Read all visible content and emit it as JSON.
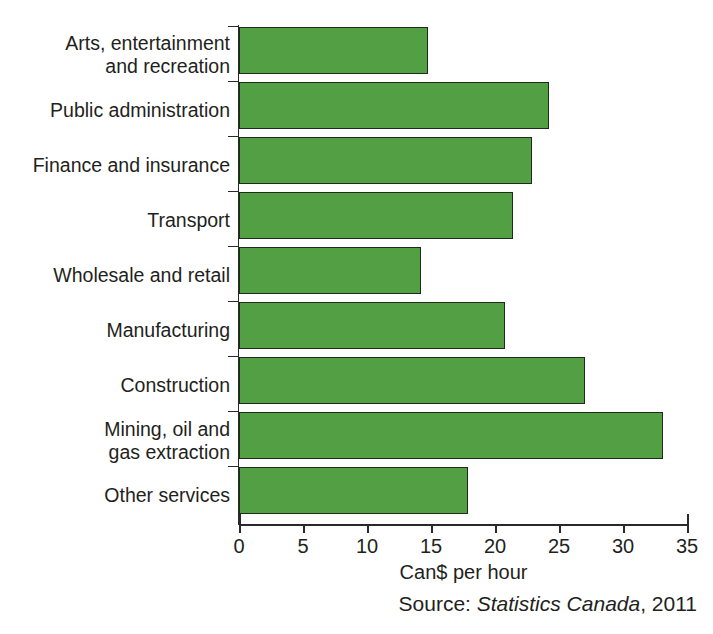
{
  "chart_data": {
    "type": "bar",
    "orientation": "horizontal",
    "title": "",
    "xlabel": "Can$ per hour",
    "ylabel": "",
    "xlim": [
      0,
      35
    ],
    "xticks": [
      0,
      5,
      10,
      15,
      20,
      25,
      30,
      35
    ],
    "xtick_labels": [
      "0",
      "5",
      "10",
      "15",
      "20",
      "25",
      "30",
      "35"
    ],
    "grid": false,
    "legend": null,
    "bar_color": "#53A044",
    "bar_edge_color": "#1d2b1a",
    "categories": [
      "Arts, entertainment\nand recreation",
      "Public administration",
      "Finance and insurance",
      "Transport",
      "Wholesale and retail",
      "Manufacturing",
      "Construction",
      "Mining, oil and\ngas extraction",
      "Other services"
    ],
    "values": [
      14.8,
      24.2,
      22.9,
      21.4,
      14.2,
      20.8,
      27.0,
      33.1,
      17.9
    ],
    "source": {
      "prefix": "Source: ",
      "emphasis": "Statistics Canada",
      "suffix": ", 2011"
    }
  }
}
